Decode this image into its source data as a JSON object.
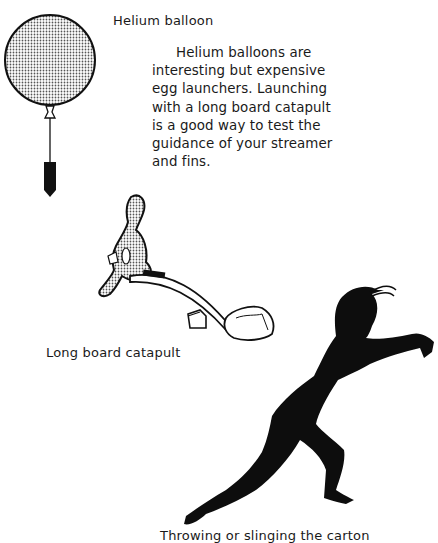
{
  "captions": {
    "balloon": "Helium balloon",
    "catapult": "Long board catapult",
    "throwing": "Throwing or slinging the carton"
  },
  "paragraph": {
    "lines": [
      "Helium balloons are",
      "interesting but expensive",
      "egg launchers.  Launching",
      "with a long board catapult",
      "is a good way to test the",
      "guidance of your streamer",
      "and fins."
    ]
  },
  "illustrations": [
    {
      "name": "helium-balloon",
      "fill": "stippled gray",
      "payload": "black egg carton"
    },
    {
      "name": "long-board-catapult",
      "parts": [
        "stippled figure",
        "board",
        "fulcrum block",
        "rock",
        "egg carton"
      ]
    },
    {
      "name": "throwing-figure",
      "fill": "black silhouette"
    }
  ],
  "colors": {
    "ink": "#111111",
    "paper": "#ffffff",
    "stipple": "#8a8a8a"
  }
}
